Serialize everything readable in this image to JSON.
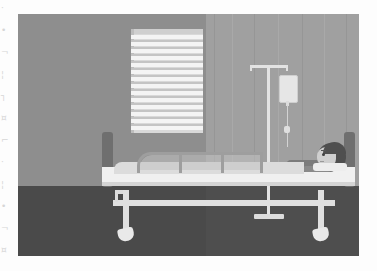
{
  "scene": {
    "title": "Hospital room with patient in bed",
    "type": "flat-vector-illustration",
    "palette": "grayscale",
    "canvas": {
      "width": 377,
      "height": 271
    },
    "artwork_frame": {
      "left": 18,
      "top": 14,
      "width": 341,
      "height": 242
    }
  },
  "colors": {
    "wall_left": "#8e8e8e",
    "wall_right": "#9a9a9a",
    "curtain": "#a0a0a0",
    "floor": "#4a4a4a",
    "floor_right": "#4e4e4e",
    "blinds_slat": "#f4f4f4",
    "blinds_body": "#d9d9d9",
    "bed_frame": "#e0e0e0",
    "bed_post": "#6f6f6f",
    "mattress": "#f0f0f0",
    "blanket": "#dcdcdc",
    "rail": "#9e9e9e",
    "iv_metal": "#e3e3e3",
    "iv_bag": "#e6e6e6",
    "skin": "#cfcfcf",
    "hair": "#4f4f4f",
    "gown": "#7b7b7b",
    "page_background": "#fdfdfd"
  },
  "objects": {
    "window": {
      "name": "window-with-venetian-blinds",
      "slat_count": 13,
      "slat_height_px": 4,
      "gap_height_px": 2
    },
    "iv_stand": {
      "name": "iv-drip-stand",
      "parts": [
        "crossbar",
        "hooks",
        "pole",
        "iv-bag",
        "drip-chamber",
        "tube",
        "base"
      ],
      "bag_label": ""
    },
    "bed": {
      "name": "hospital-bed",
      "parts": [
        "footboard",
        "headboard",
        "mattress",
        "blanket",
        "pillow",
        "side-rail",
        "frame-bar",
        "legs",
        "casters"
      ],
      "caster_count": 2,
      "rail_segments": 3
    },
    "patient": {
      "name": "patient-lying-in-bed",
      "orientation": "head-right-facing-left",
      "parts": [
        "head",
        "hair",
        "face",
        "eye",
        "brow",
        "mouth",
        "neck",
        "torso",
        "arm",
        "legs"
      ]
    },
    "curtain": {
      "name": "privacy-curtain",
      "fold_count": 7
    }
  },
  "margin_artifacts": {
    "description": "faint scanner bleed-through marks along left page edge",
    "marks": [
      "·",
      "•",
      "¬",
      "¦",
      "┐",
      "¤",
      "⌐",
      "·",
      "¦",
      "•",
      "¬",
      "¤"
    ]
  }
}
